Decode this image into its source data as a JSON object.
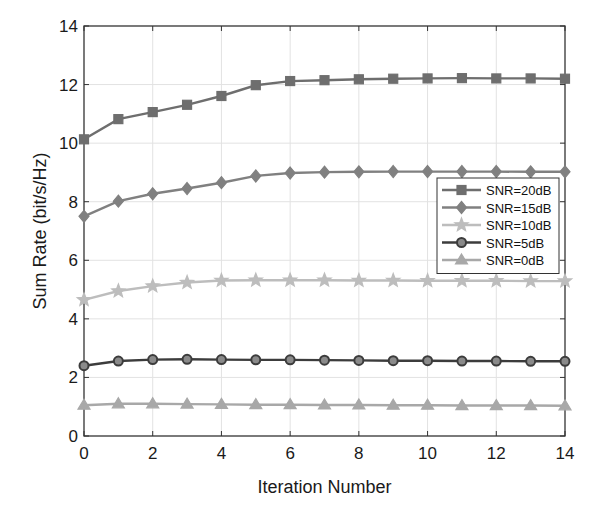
{
  "chart_data": {
    "type": "line",
    "title": "",
    "xlabel": "Iteration Number",
    "ylabel": "Sum Rate (bit/s/Hz)",
    "xlim": [
      0,
      14
    ],
    "ylim": [
      0,
      14
    ],
    "xticks": [
      0,
      2,
      4,
      6,
      8,
      10,
      12,
      14
    ],
    "yticks": [
      0,
      2,
      4,
      6,
      8,
      10,
      12,
      14
    ],
    "grid": true,
    "legend_position": "right-middle inside",
    "x": [
      0,
      1,
      2,
      3,
      4,
      5,
      6,
      7,
      8,
      9,
      10,
      11,
      12,
      13,
      14
    ],
    "series": [
      {
        "name": "SNR=20dB",
        "marker": "square",
        "color": "#6e6e6e",
        "values": [
          10.13,
          10.82,
          11.06,
          11.31,
          11.61,
          11.98,
          12.12,
          12.15,
          12.18,
          12.2,
          12.21,
          12.22,
          12.21,
          12.21,
          12.2
        ]
      },
      {
        "name": "SNR=15dB",
        "marker": "diamond",
        "color": "#808080",
        "values": [
          7.5,
          8.02,
          8.27,
          8.45,
          8.65,
          8.88,
          8.98,
          9.01,
          9.02,
          9.03,
          9.03,
          9.03,
          9.03,
          9.02,
          9.02
        ]
      },
      {
        "name": "SNR=10dB",
        "marker": "star",
        "color": "#bdbdbd",
        "values": [
          4.65,
          4.95,
          5.12,
          5.24,
          5.31,
          5.32,
          5.32,
          5.32,
          5.31,
          5.31,
          5.3,
          5.3,
          5.3,
          5.29,
          5.29
        ]
      },
      {
        "name": "SNR=5dB",
        "marker": "circle",
        "color": "#3c3c3c",
        "values": [
          2.4,
          2.56,
          2.61,
          2.62,
          2.61,
          2.6,
          2.6,
          2.59,
          2.58,
          2.57,
          2.57,
          2.56,
          2.56,
          2.55,
          2.55
        ]
      },
      {
        "name": "SNR=0dB",
        "marker": "triangle",
        "color": "#a8a8a8",
        "values": [
          1.05,
          1.1,
          1.1,
          1.09,
          1.08,
          1.07,
          1.07,
          1.06,
          1.06,
          1.05,
          1.05,
          1.04,
          1.04,
          1.04,
          1.03
        ]
      }
    ]
  }
}
